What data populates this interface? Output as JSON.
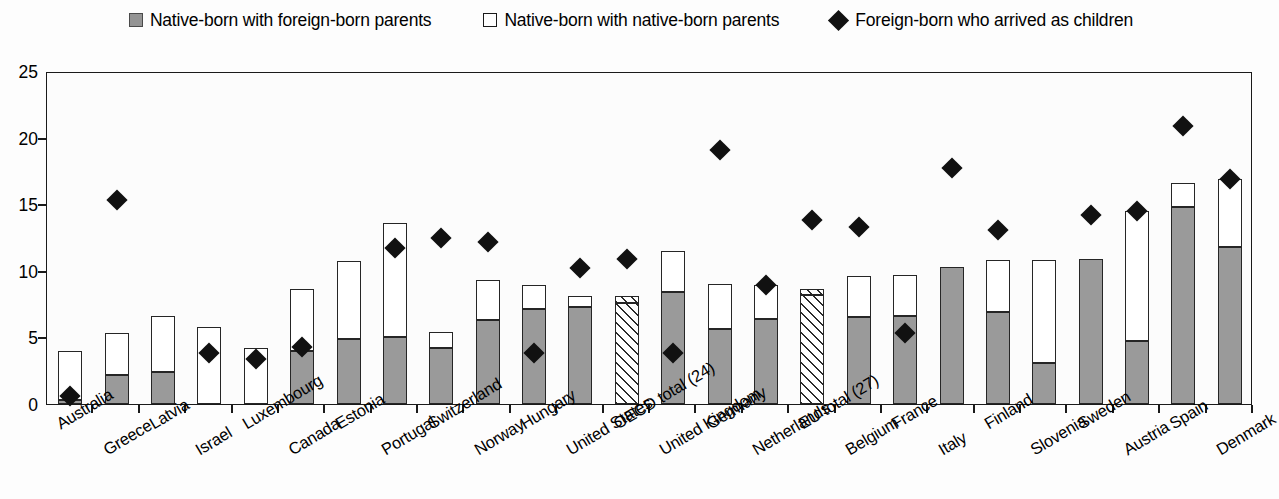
{
  "legend": {
    "items": [
      {
        "label": "Native-born with foreign-born parents",
        "swatch": "gray-square-icon"
      },
      {
        "label": "Native-born with native-born parents",
        "swatch": "white-square-icon"
      },
      {
        "label": "Foreign-born who arrived as children",
        "swatch": "black-diamond-icon"
      }
    ]
  },
  "axes": {
    "y_ticks": [
      "0",
      "5",
      "10",
      "15",
      "20",
      "25"
    ],
    "y_min": 0,
    "y_max": 25
  },
  "colors": {
    "series_gray": "#9a9a9a",
    "series_white": "#ffffff",
    "marker": "#111111",
    "axis": "#1a1a1a"
  },
  "chart_data": {
    "type": "bar",
    "title": "",
    "xlabel": "",
    "ylabel": "",
    "ylim": [
      0,
      25
    ],
    "grid": false,
    "stacked": true,
    "legend_position": "top",
    "categories": [
      "Australia",
      "Greece",
      "Latvia",
      "Israel",
      "Luxembourg",
      "Canada",
      "Estonia",
      "Portugal",
      "Switzerland",
      "Norway",
      "Hungary",
      "United States",
      "OECD total (24)",
      "United Kingdom",
      "Germany",
      "Netherlands",
      "EU total (27)",
      "Belgium",
      "France",
      "Italy",
      "Finland",
      "Slovenia",
      "Sweden",
      "Austria",
      "Spain",
      "Denmark"
    ],
    "aggregate_categories": [
      "OECD total (24)",
      "EU total (27)"
    ],
    "series": [
      {
        "name": "Native-born with foreign-born parents",
        "values": [
          0.3,
          2.2,
          2.4,
          0.0,
          0.0,
          4.0,
          4.9,
          5.0,
          4.2,
          6.3,
          7.1,
          7.3,
          7.6,
          8.4,
          5.6,
          6.4,
          8.2,
          6.5,
          6.6,
          10.3,
          6.9,
          3.1,
          10.9,
          4.7,
          14.8,
          11.8
        ]
      },
      {
        "name": "Native-born with native-born parents",
        "values": [
          3.7,
          3.1,
          4.2,
          5.8,
          4.2,
          4.6,
          5.8,
          8.6,
          1.2,
          3.0,
          1.8,
          0.8,
          0.5,
          3.1,
          3.4,
          2.5,
          0.4,
          3.1,
          3.1,
          0.0,
          3.9,
          7.7,
          0.0,
          9.8,
          1.8,
          5.1
        ]
      }
    ],
    "totals": [
      4.0,
      5.3,
      6.6,
      5.8,
      4.2,
      8.6,
      10.7,
      13.6,
      5.4,
      9.3,
      8.9,
      8.1,
      8.1,
      11.5,
      9.0,
      8.9,
      8.6,
      9.6,
      9.7,
      10.3,
      10.8,
      10.8,
      10.9,
      14.5,
      16.6,
      16.9
    ],
    "marker_series": {
      "name": "Foreign-born who arrived as children",
      "marker": "diamond",
      "values": [
        0.6,
        15.3,
        null,
        3.8,
        3.4,
        4.3,
        null,
        11.7,
        12.5,
        12.2,
        3.8,
        10.2,
        10.9,
        3.8,
        19.1,
        8.9,
        13.8,
        13.3,
        5.3,
        17.7,
        13.1,
        null,
        14.2,
        14.5,
        20.9,
        16.9
      ]
    }
  }
}
